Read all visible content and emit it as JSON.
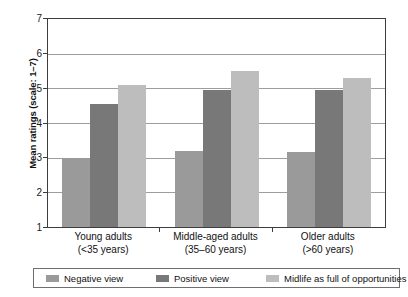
{
  "chart_data": {
    "type": "bar",
    "title": "",
    "xlabel": "",
    "ylabel": "Mean ratings (scale: 1–7)",
    "ylim": [
      1,
      7
    ],
    "yticks": [
      1,
      2,
      3,
      4,
      5,
      6,
      7
    ],
    "grid": true,
    "legend_position": "bottom",
    "categories": [
      "Young adults\n(<35 years)",
      "Middle-aged adults\n(35–60 years)",
      "Older adults\n(>60 years)"
    ],
    "category_lines": [
      [
        "Young adults",
        "(<35 years)"
      ],
      [
        "Middle-aged adults",
        "(35–60 years)"
      ],
      [
        "Older adults",
        "(>60 years)"
      ]
    ],
    "series": [
      {
        "name": "Negative view",
        "color": "#9a9a9a",
        "values": [
          3.0,
          3.2,
          3.15
        ]
      },
      {
        "name": "Positive view",
        "color": "#787878",
        "values": [
          4.55,
          4.95,
          4.95
        ]
      },
      {
        "name": "Midlife as full of opportunities",
        "color": "#bdbdbd",
        "values": [
          5.1,
          5.5,
          5.3
        ]
      }
    ]
  },
  "axes": {
    "y_title": "Mean ratings (scale: 1–7)",
    "y_tick_labels": [
      "7",
      "6",
      "5",
      "4",
      "3",
      "2",
      "1"
    ]
  },
  "legend": {
    "entries": [
      {
        "label": "Negative view",
        "color": "#9a9a9a"
      },
      {
        "label": "Positive view",
        "color": "#787878"
      },
      {
        "label": "Midlife as full of opportunities",
        "color": "#bdbdbd"
      }
    ]
  }
}
